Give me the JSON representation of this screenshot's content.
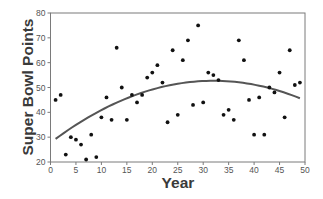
{
  "chart_data": {
    "type": "scatter",
    "title": "",
    "xlabel": "Year",
    "ylabel": "Super Bowl Points",
    "xlim": [
      0,
      50
    ],
    "ylim": [
      20,
      80
    ],
    "xticks": [
      0,
      5,
      10,
      15,
      20,
      25,
      30,
      35,
      40,
      45,
      50
    ],
    "yticks": [
      20,
      30,
      40,
      50,
      60,
      70,
      80
    ],
    "grid": false,
    "legend": null,
    "series": [
      {
        "name": "Super Bowl Points",
        "kind": "scatter",
        "color": "#111111",
        "x": [
          1,
          2,
          3,
          4,
          5,
          6,
          7,
          8,
          9,
          10,
          11,
          12,
          13,
          14,
          15,
          16,
          17,
          18,
          19,
          20,
          21,
          22,
          23,
          24,
          25,
          26,
          27,
          28,
          29,
          30,
          31,
          32,
          33,
          34,
          35,
          36,
          37,
          38,
          39,
          40,
          41,
          42,
          43,
          44,
          45,
          46,
          47,
          48,
          49
        ],
        "y": [
          45,
          47,
          23,
          30,
          29,
          27,
          21,
          31,
          22,
          38,
          46,
          37,
          66,
          50,
          37,
          47,
          44,
          47,
          54,
          56,
          59,
          52,
          36,
          65,
          39,
          61,
          69,
          43,
          75,
          44,
          56,
          55,
          53,
          39,
          41,
          37,
          69,
          61,
          45,
          31,
          46,
          31,
          50,
          48,
          56,
          38,
          65,
          51,
          52
        ]
      },
      {
        "name": "Quadratic trend",
        "kind": "line",
        "color": "#555555",
        "model": "quadratic",
        "vertex": [
          32,
          52.7
        ],
        "curvature": -0.02435,
        "x_range": [
          1,
          49
        ]
      }
    ]
  }
}
